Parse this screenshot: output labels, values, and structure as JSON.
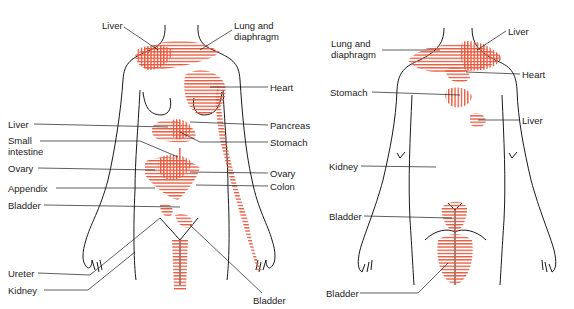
{
  "figure": {
    "accent_color": "#e8553a",
    "line_color": "#1a1a1a",
    "front_view": {
      "labels": {
        "liver_top": "Liver",
        "lung": "Lung and\ndiaphragm",
        "heart": "Heart",
        "liver_mid": "Liver",
        "pancreas": "Pancreas",
        "small_intestine": "Small\nintestine",
        "stomach": "Stomach",
        "ovary_left": "Ovary",
        "ovary_right": "Ovary",
        "appendix": "Appendix",
        "colon": "Colon",
        "bladder_left": "Bladder",
        "ureter": "Ureter",
        "kidney": "Kidney",
        "bladder_bottom": "Bladder"
      }
    },
    "back_view": {
      "labels": {
        "lung": "Lung and\ndiaphragm",
        "liver_top": "Liver",
        "heart": "Heart",
        "stomach": "Stomach",
        "liver_mid": "Liver",
        "kidney": "Kidney",
        "bladder_mid": "Bladder",
        "bladder_bottom": "Bladder"
      }
    }
  }
}
